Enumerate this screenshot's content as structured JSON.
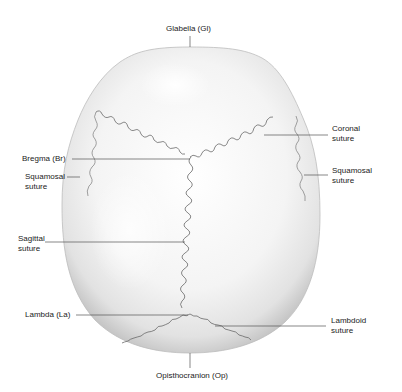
{
  "labels": {
    "glabella": "Glabella (Gl)",
    "bregma": "Bregma (Br)",
    "squamosal_left_1": "Squamosal",
    "squamosal_left_2": "suture",
    "sagittal_1": "Sagittal",
    "sagittal_2": "suture",
    "lambda": "Lambda (La)",
    "coronal_1": "Coronal",
    "coronal_2": "suture",
    "squamosal_right_1": "Squamosal",
    "squamosal_right_2": "suture",
    "lambdoid_1": "Lambdoid",
    "lambdoid_2": "suture",
    "opisthocranion": "Opisthocranion (Op)"
  },
  "colors": {
    "bone_light": "#f7f7f7",
    "bone_shadow": "#c9c9c9",
    "suture": "#6a6a6a",
    "leader": "#555555",
    "text": "#222222"
  }
}
